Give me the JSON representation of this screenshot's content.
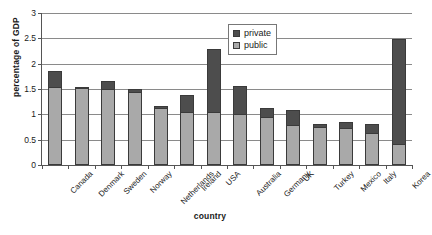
{
  "chart_data": {
    "type": "bar",
    "stacked": true,
    "title": "",
    "xlabel": "country",
    "ylabel": "percentage of GDP",
    "ylim": [
      0,
      3
    ],
    "ytick_labels": [
      "0",
      "0.5",
      "1",
      "1.5",
      "2",
      "2.5",
      "3"
    ],
    "ytick_values": [
      0,
      0.5,
      1,
      1.5,
      2,
      2.5,
      3
    ],
    "grid": true,
    "legend_position": "top-right",
    "categories": [
      "Canada",
      "Denmark",
      "Sweden",
      "Norway",
      "Netherlands",
      "Ireland",
      "USA",
      "Australia",
      "Germany",
      "UK",
      "Turkey",
      "Mexico",
      "Italy",
      "Korea"
    ],
    "series": [
      {
        "name": "public",
        "color": "#a9a9a9",
        "values": [
          1.53,
          1.52,
          1.5,
          1.44,
          1.13,
          1.05,
          1.04,
          1.01,
          0.95,
          0.79,
          0.76,
          0.73,
          0.63,
          0.41
        ]
      },
      {
        "name": "private",
        "color": "#4d4d4d",
        "values": [
          0.33,
          0.01,
          0.15,
          0.06,
          0.03,
          0.33,
          1.25,
          0.54,
          0.18,
          0.3,
          0.04,
          0.12,
          0.18,
          2.07
        ]
      }
    ],
    "totals": [
      1.86,
      1.53,
      1.65,
      1.5,
      1.16,
      1.38,
      2.29,
      1.55,
      1.13,
      1.09,
      0.8,
      0.85,
      0.81,
      2.48
    ]
  },
  "legend": {
    "entries": [
      {
        "label": "private",
        "swatch": "private-swatch"
      },
      {
        "label": "public",
        "swatch": "public-swatch"
      }
    ]
  }
}
